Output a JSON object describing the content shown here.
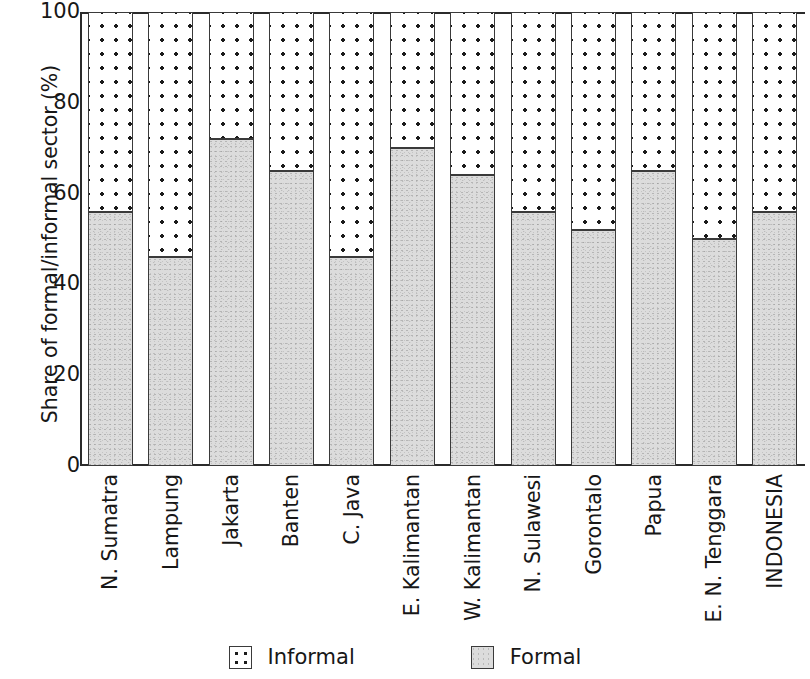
{
  "chart_data": {
    "type": "bar",
    "subtype": "stacked-100-percent",
    "title": "",
    "xlabel": "",
    "ylabel": "Share of formal/informal sector (%)",
    "ylim": [
      0,
      100
    ],
    "yticks": [
      0,
      20,
      40,
      60,
      80,
      100
    ],
    "ytick_labels": [
      "0",
      "20",
      "40",
      "60",
      "80",
      "100"
    ],
    "grid": false,
    "legend_position": "bottom-center",
    "categories": [
      "N. Sumatra",
      "Lampung",
      "Jakarta",
      "Banten",
      "C. Java",
      "E. Kalimantan",
      "W. Kalimantan",
      "N. Sulawesi",
      "Gorontalo",
      "Papua",
      "E. N. Tenggara",
      "INDONESIA"
    ],
    "series": [
      {
        "name": "Formal",
        "fill": "gray-stipple",
        "color": "#dcdcdc",
        "values": [
          56,
          46,
          72,
          65,
          46,
          70,
          64,
          56,
          52,
          65,
          50,
          56
        ]
      },
      {
        "name": "Informal",
        "fill": "dotted",
        "color": "#ffffff",
        "values": [
          44,
          54,
          28,
          35,
          54,
          30,
          36,
          44,
          48,
          35,
          50,
          44
        ]
      }
    ],
    "legend": [
      {
        "label": "Informal",
        "swatch": "informal"
      },
      {
        "label": "Formal",
        "swatch": "formal"
      }
    ]
  }
}
